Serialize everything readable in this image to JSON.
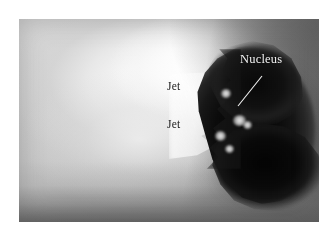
{
  "figure": {
    "kind": "grayscale-astronomical-photograph",
    "page_background": "#ffffff",
    "plate": {
      "left": 19,
      "top": 19,
      "width": 300,
      "height": 203,
      "tone_light": "#fdfdfd",
      "tone_mid": "#b9b9b9",
      "tone_dark": "#070707",
      "sky_right": "#6a6a6a"
    }
  },
  "annotations": [
    {
      "id": "nucleus",
      "label": "Nucleus",
      "color": "#f2f2f2",
      "style": "white-serif",
      "has_leader_line": true,
      "leader_color": "#f4f4f4",
      "leader_from": {
        "x": 262,
        "y": 76
      },
      "leader_to": {
        "x": 238,
        "y": 106
      }
    },
    {
      "id": "jet-upper",
      "label": "Jet",
      "color": "#191919",
      "style": "dark-serif",
      "has_leader_line": false
    },
    {
      "id": "jet-lower",
      "label": "Jet",
      "color": "#191919",
      "style": "dark-serif",
      "has_leader_line": false
    }
  ]
}
